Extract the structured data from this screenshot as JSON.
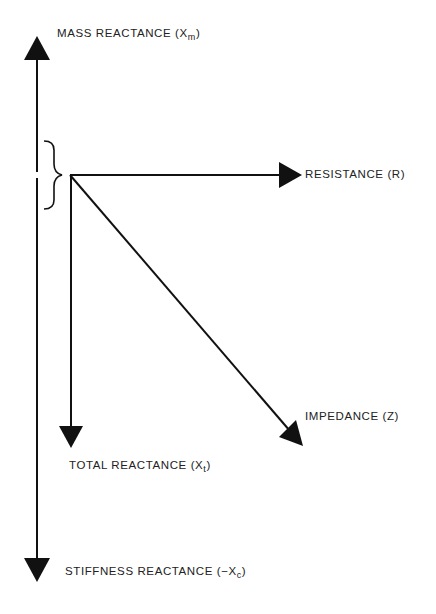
{
  "diagram": {
    "type": "impedance-phasor-diagram",
    "stroke_color": "#111111",
    "background": "#ffffff",
    "labels": {
      "mass_reactance": {
        "text": "MASS REACTANCE  (X",
        "sub": "m",
        "close": ")"
      },
      "resistance": {
        "text": "RESISTANCE  (R)"
      },
      "impedance": {
        "text": "IMPEDANCE  (Z)"
      },
      "total_reactance": {
        "text": "TOTAL REACTANCE  (X",
        "sub": "t",
        "close": ")"
      },
      "stiffness_reactance": {
        "text": "STIFFNESS REACTANCE (−X",
        "sub": "c",
        "close": ")"
      }
    },
    "vectors": [
      {
        "name": "mass-reactance",
        "direction": "up",
        "from": [
          37,
          175
        ],
        "to": [
          37,
          36
        ]
      },
      {
        "name": "stiffness-reactance",
        "direction": "down",
        "from": [
          37,
          175
        ],
        "to": [
          37,
          582
        ]
      },
      {
        "name": "resistance",
        "direction": "right",
        "from": [
          70,
          175
        ],
        "to": [
          302,
          175
        ]
      },
      {
        "name": "total-reactance",
        "direction": "down",
        "from": [
          71,
          175
        ],
        "to": [
          71,
          448
        ]
      },
      {
        "name": "impedance",
        "direction": "down-right",
        "from": [
          70,
          175
        ],
        "to": [
          303,
          446
        ]
      }
    ],
    "brace": {
      "description": "curly brace grouping mass and stiffness reactance into total reactance",
      "x": 54,
      "y_top": 140,
      "y_bottom": 210
    }
  }
}
